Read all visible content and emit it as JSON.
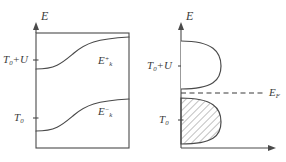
{
  "figure": {
    "background": "#ffffff",
    "stroke_color": "#4a4a4a",
    "hatch_color": "#6b6b6b"
  },
  "panels": [
    {
      "id": "band-dispersion",
      "axis_label": "E",
      "frame": "closed-rectangle",
      "ticks": [
        {
          "name": "t0-plus-u",
          "label_main": "T",
          "label_sub": "0",
          "label_rest": "+U"
        },
        {
          "name": "t0",
          "label_main": "T",
          "label_sub": "0",
          "label_rest": ""
        }
      ],
      "curves": [
        {
          "name": "upper-band",
          "label_main": "E",
          "label_sub": "k",
          "label_sup": "+"
        },
        {
          "name": "lower-band",
          "label_main": "E",
          "label_sub": "k",
          "label_sup": "−"
        }
      ]
    },
    {
      "id": "density-of-states",
      "axis_label": "E",
      "frame": "L-shaped-axes-with-arrows",
      "ticks": [
        {
          "name": "t0-plus-u",
          "label_main": "T",
          "label_sub": "0",
          "label_rest": "+U"
        },
        {
          "name": "t0",
          "label_main": "T",
          "label_sub": "0",
          "label_rest": ""
        }
      ],
      "lobes": [
        {
          "name": "upper-lobe",
          "filled": false
        },
        {
          "name": "lower-lobe",
          "filled": true,
          "fill_style": "diagonal-hatch"
        }
      ],
      "fermi_level": {
        "name": "fermi-level",
        "style": "dashed",
        "label_main": "E",
        "label_sub": "F"
      }
    }
  ]
}
